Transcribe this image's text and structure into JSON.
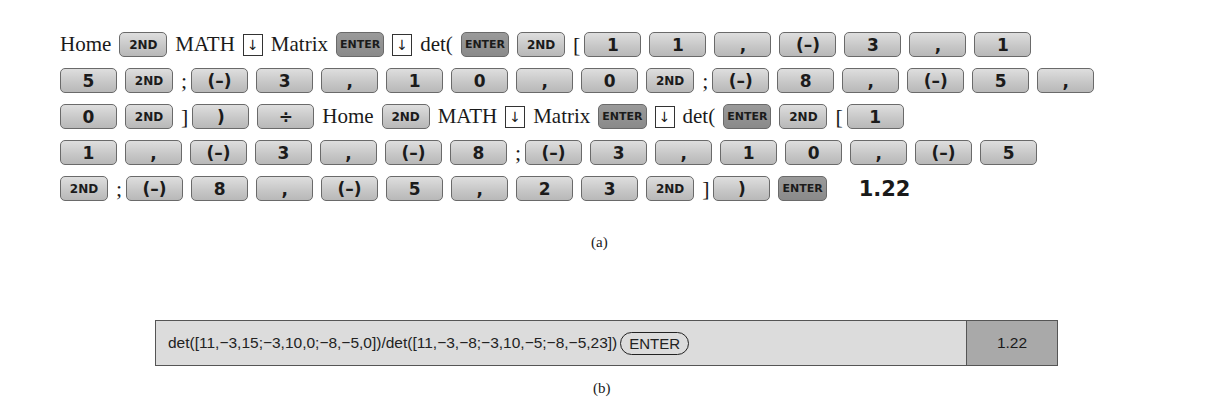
{
  "part_a": {
    "caption": "(a)",
    "rows": [
      [
        {
          "t": "text",
          "v": "Home"
        },
        {
          "t": "key",
          "v": "2ND",
          "k": "two"
        },
        {
          "t": "text",
          "v": "MATH"
        },
        {
          "t": "arrow",
          "v": "↓"
        },
        {
          "t": "text",
          "v": "Matrix"
        },
        {
          "t": "key",
          "v": "ENTER",
          "k": "enter"
        },
        {
          "t": "arrow",
          "v": "↓"
        },
        {
          "t": "text",
          "v": "det("
        },
        {
          "t": "key",
          "v": "ENTER",
          "k": "enter"
        },
        {
          "t": "key",
          "v": "2ND",
          "k": "two"
        },
        {
          "t": "punct",
          "v": "["
        },
        {
          "t": "key",
          "v": "1",
          "k": "num"
        },
        {
          "t": "key",
          "v": "1",
          "k": "num"
        },
        {
          "t": "key",
          "v": ",",
          "k": "num"
        },
        {
          "t": "key",
          "v": "(–)",
          "k": "num"
        },
        {
          "t": "key",
          "v": "3",
          "k": "num"
        },
        {
          "t": "key",
          "v": ",",
          "k": "num"
        },
        {
          "t": "key",
          "v": "1",
          "k": "num"
        }
      ],
      [
        {
          "t": "key",
          "v": "5",
          "k": "num"
        },
        {
          "t": "key",
          "v": "2ND",
          "k": "two"
        },
        {
          "t": "punct",
          "v": ";"
        },
        {
          "t": "key",
          "v": "(–)",
          "k": "num"
        },
        {
          "t": "key",
          "v": "3",
          "k": "num"
        },
        {
          "t": "key",
          "v": ",",
          "k": "num"
        },
        {
          "t": "key",
          "v": "1",
          "k": "num"
        },
        {
          "t": "key",
          "v": "0",
          "k": "num"
        },
        {
          "t": "key",
          "v": ",",
          "k": "num"
        },
        {
          "t": "key",
          "v": "0",
          "k": "num"
        },
        {
          "t": "key",
          "v": "2ND",
          "k": "two"
        },
        {
          "t": "punct",
          "v": ";"
        },
        {
          "t": "key",
          "v": "(–)",
          "k": "num"
        },
        {
          "t": "key",
          "v": "8",
          "k": "num"
        },
        {
          "t": "key",
          "v": ",",
          "k": "num"
        },
        {
          "t": "key",
          "v": "(–)",
          "k": "num"
        },
        {
          "t": "key",
          "v": "5",
          "k": "num"
        },
        {
          "t": "key",
          "v": ",",
          "k": "num"
        }
      ],
      [
        {
          "t": "key",
          "v": "0",
          "k": "num"
        },
        {
          "t": "key",
          "v": "2ND",
          "k": "two"
        },
        {
          "t": "punct",
          "v": "]"
        },
        {
          "t": "key",
          "v": ")",
          "k": "num"
        },
        {
          "t": "key",
          "v": "÷",
          "k": "num"
        },
        {
          "t": "text",
          "v": "Home"
        },
        {
          "t": "key",
          "v": "2ND",
          "k": "two"
        },
        {
          "t": "text",
          "v": "MATH"
        },
        {
          "t": "arrow",
          "v": "↓"
        },
        {
          "t": "text",
          "v": "Matrix"
        },
        {
          "t": "key",
          "v": "ENTER",
          "k": "enter"
        },
        {
          "t": "arrow",
          "v": "↓"
        },
        {
          "t": "text",
          "v": "det("
        },
        {
          "t": "key",
          "v": "ENTER",
          "k": "enter"
        },
        {
          "t": "key",
          "v": "2ND",
          "k": "two"
        },
        {
          "t": "punct",
          "v": "["
        },
        {
          "t": "key",
          "v": "1",
          "k": "num"
        }
      ],
      [
        {
          "t": "key",
          "v": "1",
          "k": "num"
        },
        {
          "t": "key",
          "v": ",",
          "k": "num"
        },
        {
          "t": "key",
          "v": "(–)",
          "k": "num"
        },
        {
          "t": "key",
          "v": "3",
          "k": "num"
        },
        {
          "t": "key",
          "v": ",",
          "k": "num"
        },
        {
          "t": "key",
          "v": "(–)",
          "k": "num"
        },
        {
          "t": "key",
          "v": "8",
          "k": "num"
        },
        {
          "t": "punct",
          "v": ";"
        },
        {
          "t": "key",
          "v": "(–)",
          "k": "num"
        },
        {
          "t": "key",
          "v": "3",
          "k": "num"
        },
        {
          "t": "key",
          "v": ",",
          "k": "num"
        },
        {
          "t": "key",
          "v": "1",
          "k": "num"
        },
        {
          "t": "key",
          "v": "0",
          "k": "num"
        },
        {
          "t": "key",
          "v": ",",
          "k": "num"
        },
        {
          "t": "key",
          "v": "(–)",
          "k": "num"
        },
        {
          "t": "key",
          "v": "5",
          "k": "num"
        }
      ],
      [
        {
          "t": "key",
          "v": "2ND",
          "k": "two"
        },
        {
          "t": "punct",
          "v": ";"
        },
        {
          "t": "key",
          "v": "(–)",
          "k": "num"
        },
        {
          "t": "key",
          "v": "8",
          "k": "num"
        },
        {
          "t": "key",
          "v": ",",
          "k": "num"
        },
        {
          "t": "key",
          "v": "(–)",
          "k": "num"
        },
        {
          "t": "key",
          "v": "5",
          "k": "num"
        },
        {
          "t": "key",
          "v": ",",
          "k": "num"
        },
        {
          "t": "key",
          "v": "2",
          "k": "num"
        },
        {
          "t": "key",
          "v": "3",
          "k": "num"
        },
        {
          "t": "key",
          "v": "2ND",
          "k": "two"
        },
        {
          "t": "punct",
          "v": "]"
        },
        {
          "t": "key",
          "v": ")",
          "k": "num"
        },
        {
          "t": "key",
          "v": "ENTER",
          "k": "enter"
        },
        {
          "t": "result",
          "v": "1.22"
        }
      ]
    ]
  },
  "part_b": {
    "caption": "(b)",
    "expression": "det([11,−3,15;−3,10,0;−8,−5,0])/det([11,−3,−8;−3,10,−5;−8,−5,23])",
    "enter_label": "ENTER",
    "result": "1.22"
  }
}
